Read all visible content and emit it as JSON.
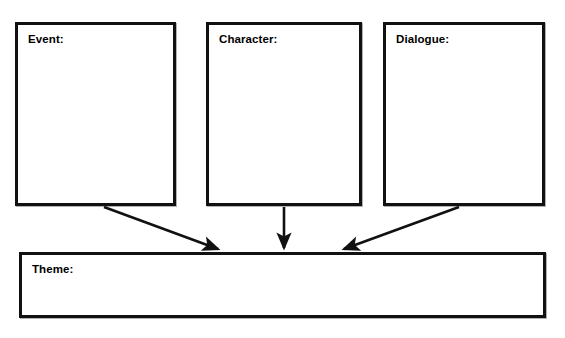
{
  "worksheet": {
    "type": "graphic-organizer",
    "background_color": "#ffffff",
    "line_color": "#111111",
    "text_color": "#000000",
    "boxes": [
      {
        "id": "event",
        "label": "Event:",
        "value": ""
      },
      {
        "id": "character",
        "label": "Character:",
        "value": ""
      },
      {
        "id": "dialogue",
        "label": "Dialogue:",
        "value": ""
      },
      {
        "id": "theme",
        "label": "Theme:",
        "value": ""
      }
    ],
    "connectors": [
      {
        "id": "event-to-theme",
        "from": "event",
        "to": "theme",
        "style": "diagonal-arrow",
        "direction": "down-right"
      },
      {
        "id": "character-to-theme",
        "from": "character",
        "to": "theme",
        "style": "straight-arrow",
        "direction": "down"
      },
      {
        "id": "dialogue-to-theme",
        "from": "dialogue",
        "to": "theme",
        "style": "diagonal-arrow",
        "direction": "down-left"
      }
    ]
  }
}
